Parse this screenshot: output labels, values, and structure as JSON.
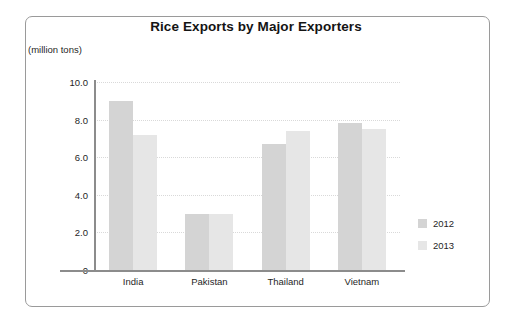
{
  "chart_data": {
    "type": "bar",
    "title": "Rice Exports by Major Exporters",
    "xlabel": "",
    "ylabel": "(million tons)",
    "categories": [
      "India",
      "Pakistan",
      "Thailand",
      "Vietnam"
    ],
    "series": [
      {
        "name": "2012",
        "color": "#d4d4d4",
        "values": [
          9.0,
          3.0,
          6.7,
          7.8
        ]
      },
      {
        "name": "2013",
        "color": "#e6e6e6",
        "values": [
          7.2,
          3.0,
          7.4,
          7.5
        ]
      }
    ],
    "ylim": [
      0,
      10.0
    ],
    "ytick_labels": [
      "10.0",
      "8.0",
      "6.0",
      "4.0",
      "2.0",
      "0"
    ],
    "ytick_values": [
      10.0,
      8.0,
      6.0,
      4.0,
      2.0,
      0
    ],
    "grid": "horizontal-dotted",
    "legend_position": "right"
  }
}
